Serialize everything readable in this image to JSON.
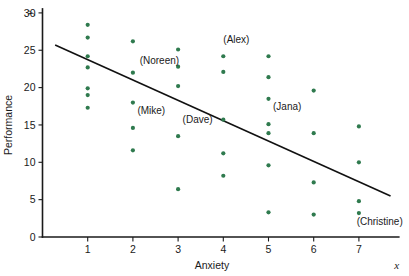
{
  "chart_data": {
    "type": "scatter",
    "title": "",
    "xlabel": "Anxiety",
    "ylabel": "Performance",
    "x_axis_variable": "x",
    "y_axis_variable": "y",
    "xlim": [
      0,
      7.75
    ],
    "ylim": [
      0,
      30
    ],
    "xticks": [
      1,
      2,
      3,
      4,
      5,
      6,
      7
    ],
    "yticks": [
      0,
      5,
      10,
      15,
      20,
      25,
      30
    ],
    "grid": false,
    "legend": "none",
    "point_color": "#2f7a4e",
    "line_color": "#111111",
    "points": [
      {
        "x": 1,
        "y": 28.4
      },
      {
        "x": 1,
        "y": 26.7
      },
      {
        "x": 1,
        "y": 24.2
      },
      {
        "x": 1,
        "y": 22.7
      },
      {
        "x": 1,
        "y": 19.9
      },
      {
        "x": 1,
        "y": 19.0
      },
      {
        "x": 1,
        "y": 17.3
      },
      {
        "x": 2,
        "y": 26.2
      },
      {
        "x": 2,
        "y": 22.0
      },
      {
        "x": 2,
        "y": 18.0
      },
      {
        "x": 2,
        "y": 14.6
      },
      {
        "x": 2,
        "y": 11.6
      },
      {
        "x": 3,
        "y": 25.1
      },
      {
        "x": 3,
        "y": 22.8
      },
      {
        "x": 3,
        "y": 20.2
      },
      {
        "x": 3,
        "y": 13.5
      },
      {
        "x": 3,
        "y": 6.4
      },
      {
        "x": 4,
        "y": 24.2
      },
      {
        "x": 4,
        "y": 22.1
      },
      {
        "x": 4,
        "y": 15.7
      },
      {
        "x": 4,
        "y": 11.2
      },
      {
        "x": 4,
        "y": 8.2
      },
      {
        "x": 5,
        "y": 24.2
      },
      {
        "x": 5,
        "y": 21.4
      },
      {
        "x": 5,
        "y": 18.5
      },
      {
        "x": 5,
        "y": 15.1
      },
      {
        "x": 5,
        "y": 13.9
      },
      {
        "x": 5,
        "y": 9.6
      },
      {
        "x": 5,
        "y": 3.3
      },
      {
        "x": 6,
        "y": 19.6
      },
      {
        "x": 6,
        "y": 13.9
      },
      {
        "x": 6,
        "y": 7.3
      },
      {
        "x": 6,
        "y": 3.0
      },
      {
        "x": 7,
        "y": 14.8
      },
      {
        "x": 7,
        "y": 10.0
      },
      {
        "x": 7,
        "y": 4.8
      },
      {
        "x": 7,
        "y": 3.2
      }
    ],
    "annotations": [
      {
        "text": "(Noreen)",
        "x": 2.15,
        "y": 23.2
      },
      {
        "text": "(Mike)",
        "x": 2.1,
        "y": 16.5
      },
      {
        "text": "(Dave)",
        "x": 3.1,
        "y": 15.3
      },
      {
        "text": "(Alex)",
        "x": 4.0,
        "y": 26.0
      },
      {
        "text": "(Jana)",
        "x": 5.1,
        "y": 17.0
      },
      {
        "text": "(Christine)",
        "x": 6.95,
        "y": 1.6
      }
    ],
    "trend_line": {
      "x_start": 0.28,
      "y_start": 25.7,
      "x_end": 7.7,
      "y_end": 5.5
    }
  }
}
